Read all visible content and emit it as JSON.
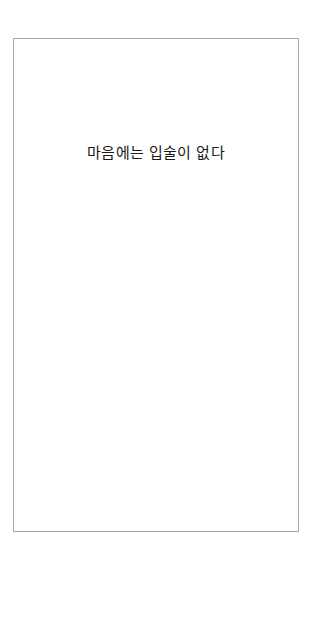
{
  "page": {
    "title": "마음에는 입술이 없다"
  },
  "colors": {
    "background": "#ffffff",
    "border": "#a8a8a8",
    "text": "#1a1a1a"
  }
}
